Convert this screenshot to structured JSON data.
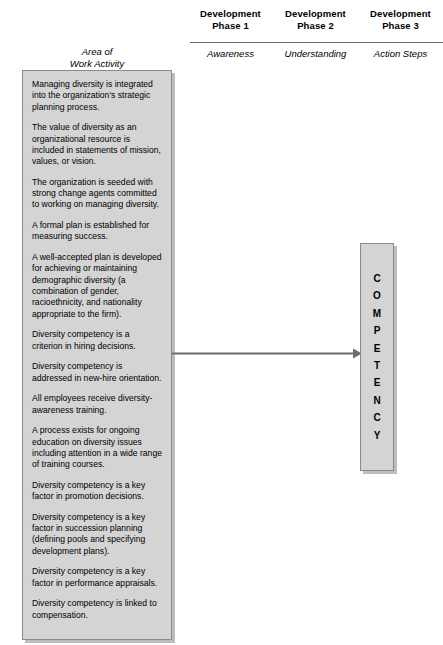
{
  "header": {
    "area_label": "Area of\nWork Activity",
    "phases": [
      {
        "title": "Development\nPhase 1",
        "subtitle": "Awareness"
      },
      {
        "title": "Development\nPhase 2",
        "subtitle": "Understanding"
      },
      {
        "title": "Development\nPhase 3",
        "subtitle": "Action Steps"
      }
    ]
  },
  "activity_box": {
    "items": [
      "Managing diversity is integrated into the organization's strategic planning process.",
      "The value of diversity as an organizational resource is included in statements of mission, values, or vision.",
      "The organization is seeded with strong change agents committed to working on managing diversity.",
      "A formal plan is established for measuring success.",
      "A well-accepted plan is developed for achieving or maintaining demographic diversity (a combination of gender, racioethnicity, and nationality appropriate to the firm).",
      "Diversity competency is a criterion in hiring decisions.",
      "Diversity competency is addressed in new-hire orientation.",
      "All employees receive diversity-awareness training.",
      "A process exists for ongoing education on diversity issues including attention in a wide range of training courses.",
      "Diversity competency is a key factor in promotion decisions.",
      "Diversity competency is a key factor in succession planning (defining pools and specifying development plans).",
      "Diversity competency is a key factor in performance appraisals.",
      "Diversity competency is linked to compensation."
    ]
  },
  "competency_box": {
    "label": "COMPETENCY",
    "letters": [
      "C",
      "O",
      "M",
      "P",
      "E",
      "T",
      "E",
      "N",
      "C",
      "Y"
    ]
  },
  "colors": {
    "box_fill": "#d4d4d4",
    "box_border": "#8a8a8a",
    "box_shadow": "#bdbdbd",
    "rule": "#6d6d6d",
    "arrow": "#6d6d6d",
    "text": "#000000"
  }
}
